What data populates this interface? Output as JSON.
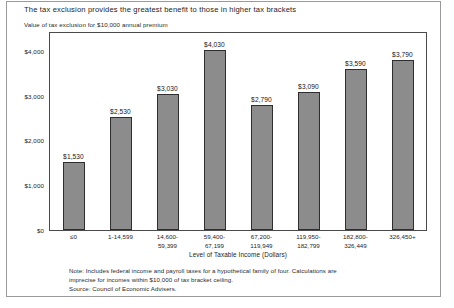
{
  "chart_data": {
    "type": "bar",
    "title": "The tax exclusion provides the greatest benefit to those in higher tax brackets",
    "subtitle": "Value of tax exclusion for $10,000 annual premium",
    "xlabel": "Level of Taxable Income (Dollars)",
    "ylabel": "",
    "categories": [
      "≤0",
      "1-14,599",
      "14,600-\n59,399",
      "59,400-\n67,199",
      "67,200-\n119,949",
      "119,950-\n182,799",
      "182,800-\n326,449",
      "326,450+"
    ],
    "category_lines": [
      [
        "≤0"
      ],
      [
        "1-14,599"
      ],
      [
        "14,600-",
        "59,399"
      ],
      [
        "59,400-",
        "67,199"
      ],
      [
        "67,200-",
        "119,949"
      ],
      [
        "119,950-",
        "182,799"
      ],
      [
        "182,800-",
        "326,449"
      ],
      [
        "326,450+"
      ]
    ],
    "values": [
      1530,
      2530,
      3030,
      4030,
      2790,
      3090,
      3590,
      3790
    ],
    "value_labels": [
      "$1,530",
      "$2,530",
      "$3,030",
      "$4,030",
      "$2,790",
      "$3,090",
      "$3,590",
      "$3,790"
    ],
    "ylim": [
      0,
      4400
    ],
    "yticks": [
      0,
      1000,
      2000,
      3000,
      4000
    ],
    "ytick_labels": [
      "$0",
      "$1,000",
      "$2,000",
      "$3,000",
      "$4,000"
    ],
    "grid": false,
    "legend": "none",
    "bar_color": "#8c8c8c",
    "bar_edge_color": "#2e2e2e",
    "frame_color": "#4a4a4a"
  },
  "notes": {
    "line1": "Note: Includes federal income and payroll taxes for a hypothetical family of four.  Calculations are",
    "line2": "imprecise for incomes within $10,000 of tax bracket ceiling.",
    "line3": "Source: Council of Economic Advisers."
  }
}
